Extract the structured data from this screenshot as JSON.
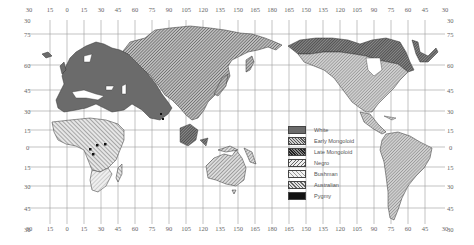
{
  "map": {
    "title": "",
    "longitude_labels_top": [
      "30",
      "15",
      "0",
      "15",
      "30",
      "45",
      "60",
      "75",
      "90",
      "105",
      "120",
      "135",
      "150",
      "165",
      "180",
      "165",
      "150",
      "135",
      "120",
      "105",
      "90",
      "75",
      "60",
      "45",
      "30"
    ],
    "longitude_labels_bottom": [
      "30",
      "15",
      "0",
      "15",
      "30",
      "45",
      "60",
      "75",
      "90",
      "105",
      "120",
      "135",
      "150",
      "165",
      "180",
      "165",
      "150",
      "135",
      "120",
      "105",
      "90",
      "75",
      "60",
      "45",
      "30"
    ],
    "latitude_labels_left": [
      "30",
      "75",
      "60",
      "45",
      "30",
      "15",
      "0",
      "15",
      "30",
      "45",
      "30"
    ],
    "latitude_labels_right": [
      "30",
      "75",
      "60",
      "45",
      "30",
      "15",
      "0",
      "15",
      "30",
      "45",
      "30"
    ],
    "legend": {
      "items": [
        {
          "label": "White",
          "pattern": "solid-dark-gray",
          "color": "#6b6b6b"
        },
        {
          "label": "Early Mongoloid",
          "pattern": "diagonal-hatch-dense",
          "color": "#8a8a8a"
        },
        {
          "label": "Late Mongoloid",
          "pattern": "diagonal-hatch-dark",
          "color": "#555555"
        },
        {
          "label": "Negro",
          "pattern": "diagonal-hatch-reverse",
          "color": "#999999"
        },
        {
          "label": "Bushman",
          "pattern": "diagonal-hatch-light",
          "color": "#b5b5b5"
        },
        {
          "label": "Australian",
          "pattern": "diagonal-hatch-medium",
          "color": "#8f8f8f"
        },
        {
          "label": "Pygmy",
          "pattern": "solid-black",
          "color": "#111111"
        }
      ]
    },
    "regions": [
      {
        "name": "Europe, North Africa, Middle East, India",
        "category": "White"
      },
      {
        "name": "Northern & Central Asia",
        "category": "Early Mongoloid"
      },
      {
        "name": "Arctic North America & Greenland",
        "category": "Late Mongoloid"
      },
      {
        "name": "Sub-Saharan Africa",
        "category": "Negro"
      },
      {
        "name": "Southern Africa",
        "category": "Bushman"
      },
      {
        "name": "Australia & New Guinea",
        "category": "Australian"
      },
      {
        "name": "Central Africa spots",
        "category": "Pygmy"
      },
      {
        "name": "North & South America",
        "category": "Early Mongoloid"
      }
    ]
  }
}
